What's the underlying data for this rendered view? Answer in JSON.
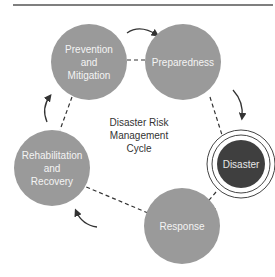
{
  "diagram": {
    "title": "Disaster Risk Management Cycle",
    "center_label_lines": [
      "Disaster Risk",
      "Management",
      "Cycle"
    ],
    "colors": {
      "stage_fill": "#9a9a9a",
      "disaster_fill": "#3f3f3f",
      "connector": "#333333",
      "text_light": "#f4f4f4",
      "text_dark": "#333333"
    },
    "nodes": [
      {
        "id": "prevention",
        "lines": [
          "Prevention",
          "and",
          "Mitigation"
        ]
      },
      {
        "id": "preparedness",
        "lines": [
          "Preparedness"
        ]
      },
      {
        "id": "disaster",
        "lines": [
          "Disaster"
        ]
      },
      {
        "id": "response",
        "lines": [
          "Response"
        ]
      },
      {
        "id": "rehabilitation",
        "lines": [
          "Rehabilitation",
          "and",
          "Recovery"
        ]
      }
    ],
    "edges": [
      {
        "from": "prevention",
        "to": "preparedness"
      },
      {
        "from": "preparedness",
        "to": "disaster"
      },
      {
        "from": "disaster",
        "to": "response"
      },
      {
        "from": "response",
        "to": "rehabilitation"
      },
      {
        "from": "rehabilitation",
        "to": "prevention"
      }
    ]
  }
}
